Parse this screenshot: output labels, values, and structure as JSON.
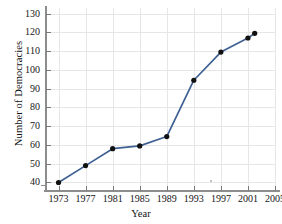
{
  "chart_data": {
    "type": "line",
    "title": "",
    "xlabel": "Year",
    "ylabel": "Number of Democracies",
    "x": [
      1973,
      1977,
      1981,
      1985,
      1989,
      1993,
      1997,
      2001,
      2002
    ],
    "values": [
      40,
      49,
      58,
      59.5,
      64.5,
      94.5,
      109.5,
      117,
      119.5
    ],
    "series": [
      {
        "name": "Number of Democracies",
        "values": [
          40,
          49,
          58,
          59.5,
          64.5,
          94.5,
          109.5,
          117,
          119.5
        ]
      }
    ],
    "xlim": [
      1971,
      2005
    ],
    "ylim": [
      36,
      133
    ],
    "xticks": [
      1973,
      1977,
      1981,
      1985,
      1989,
      1993,
      1997,
      2001,
      2005
    ],
    "yticks": [
      40,
      50,
      60,
      70,
      80,
      90,
      100,
      110,
      120,
      130
    ],
    "xtick_labels": [
      "1973",
      "1977",
      "1981",
      "1985",
      "1989",
      "1993",
      "1997",
      "2001",
      "2005"
    ],
    "ytick_labels": [
      "40",
      "50",
      "60",
      "70",
      "80",
      "90",
      "100",
      "110",
      "120",
      "130"
    ],
    "grid": true,
    "legend": false,
    "legend_position": "none",
    "marker": "filled-circle",
    "line_color": "#3f6093",
    "marker_color": "#111111",
    "grid_color": "#e6e6e6",
    "axis_color": "#8d8d8d",
    "background_color": "#ffffff"
  }
}
